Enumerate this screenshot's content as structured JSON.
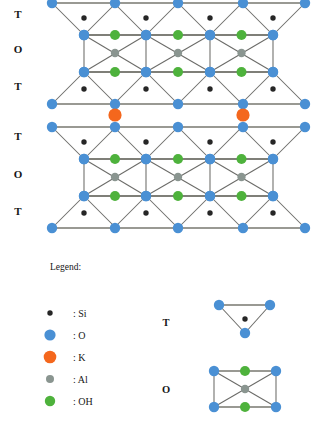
{
  "figure": {
    "width": 320,
    "height": 431
  },
  "colors": {
    "O": "#4a90d4",
    "K": "#f4671d",
    "Al": "#8a9590",
    "Si": "#262626",
    "OH": "#4eb23c",
    "bond": "#6b6b68",
    "text": "#161616",
    "background": "#ffffff"
  },
  "radii": {
    "O": 5.2,
    "K": 6.6,
    "Al": 4.2,
    "Si": 2.7,
    "OH": 5.0
  },
  "layer_labels": [
    {
      "text": "T",
      "x": 18,
      "y": 18
    },
    {
      "text": "O",
      "x": 18,
      "y": 53
    },
    {
      "text": "T",
      "x": 18,
      "y": 90
    },
    {
      "text": "T",
      "x": 18,
      "y": 140
    },
    {
      "text": "O",
      "x": 18,
      "y": 178
    },
    {
      "text": "T",
      "x": 18,
      "y": 215
    }
  ],
  "structure": {
    "rows_y": {
      "t1_top": 3,
      "t1_bot": 35,
      "o1_mid": 53,
      "o1_bot": 72,
      "t2_top": 72,
      "t2_bot": 104,
      "k_interlayer": 115,
      "t3_top": 127,
      "t3_bot": 159,
      "o2_mid": 177,
      "o2_bot": 196,
      "t4_bot": 228
    },
    "x_major": [
      52,
      115,
      178,
      243,
      305
    ],
    "x_minor": [
      84,
      146,
      210,
      273
    ],
    "k_positions": [
      115,
      243
    ]
  },
  "legend": {
    "title": "Legend:",
    "swatch_x": 50,
    "label_x": 73,
    "items": [
      {
        "species": "Si",
        "label": ": Si",
        "color": "#262626",
        "radius": 2.7,
        "y": 313
      },
      {
        "species": "O",
        "label": ": O",
        "color": "#4a90d4",
        "radius": 5.6,
        "y": 335
      },
      {
        "species": "K",
        "label": ": K",
        "color": "#f4671d",
        "radius": 6.3,
        "y": 357
      },
      {
        "species": "Al",
        "label": ": Al",
        "color": "#8a9590",
        "radius": 4.0,
        "y": 379
      },
      {
        "species": "OH",
        "label": ": OH",
        "color": "#4eb23c",
        "radius": 5.2,
        "y": 401
      }
    ],
    "diagrams": [
      {
        "name": "tetrahedron",
        "label": "T",
        "label_x": 166,
        "label_y": 326,
        "top_y": 305,
        "apex_y": 333,
        "left_x": 219,
        "right_x": 270,
        "apex_x": 245,
        "center_atom": "Si",
        "center_x": 245,
        "center_y": 319
      },
      {
        "name": "octahedron",
        "label": "O",
        "label_x": 166,
        "label_y": 393,
        "top_y": 371,
        "bot_y": 407,
        "left_x": 214,
        "mid_x": 245,
        "right_x": 276,
        "center_atom": "Al",
        "center_x": 245,
        "center_y": 389
      }
    ]
  }
}
